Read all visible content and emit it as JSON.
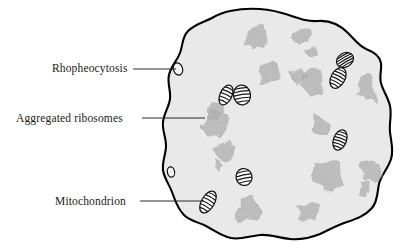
{
  "figure": {
    "background_color": "#ffffff",
    "cytoplasm_color": "#e9e9e9",
    "membrane_color": "#000000",
    "ribosome_color": "#9a9a9a",
    "mitochondrion_fill": "#ffffff",
    "mitochondrion_stroke": "#151515"
  },
  "labels": [
    {
      "id": "rhopheocytosis",
      "text": "Rhopheocytosis",
      "text_x": 52,
      "text_y": 72,
      "leader_x1": 133,
      "leader_y1": 69,
      "leader_x2": 176,
      "leader_y2": 69
    },
    {
      "id": "aggregated-ribosomes",
      "text": "Aggregated  ribosomes",
      "text_x": 16,
      "text_y": 122,
      "leader_x1": 142,
      "leader_y1": 118,
      "leader_x2": 205,
      "leader_y2": 118
    },
    {
      "id": "mitochondrion",
      "text": "Mitochondrion",
      "text_x": 55,
      "text_y": 205,
      "leader_x1": 140,
      "leader_y1": 201,
      "leader_x2": 204,
      "leader_y2": 201
    }
  ],
  "membrane_path": "M 230 11 C 250 7 268 9 282 13 C 296 17 305 22 318 21 C 330 20 340 25 348 33 C 355 40 359 46 366 49 C 374 52 380 56 381 63 C 382 70 379 76 381 83 C 383 91 388 97 390 106 C 392 115 389 123 390 132 C 391 142 394 150 391 159 C 388 169 381 175 379 184 C 377 193 378 201 372 208 C 365 216 356 219 347 222 C 337 225 329 230 320 234 C 310 238 300 240 290 239 C 279 238 270 234 260 235 C 249 236 241 240 231 238 C 221 236 214 230 206 226 C 198 222 190 221 184 215 C 177 208 175 200 172 192 C 169 184 164 178 163 170 C 162 161 166 154 166 146 C 166 137 162 130 163 122 C 164 113 169 107 170 99 C 171 90 167 83 169 75 C 171 66 177 61 180 53 C 183 45 182 37 188 31 C 195 24 204 22 212 18 C 219 14 224 12 230 11 Z",
  "vesicles": [
    {
      "id": "rhopheocytosis-vesicle-upper",
      "cx": 178,
      "cy": 69,
      "rx": 4.6,
      "ry": 6.2,
      "rot": -18
    },
    {
      "id": "rhopheocytosis-vesicle-lower",
      "cx": 171,
      "cy": 172,
      "rx": 3.6,
      "ry": 5.2,
      "rot": -10
    }
  ],
  "mitochondria": [
    {
      "id": "mito-1",
      "cx": 226,
      "cy": 95,
      "rx": 6.0,
      "ry": 10.5,
      "rot": 25,
      "cristae": 5
    },
    {
      "id": "mito-2",
      "cx": 242,
      "cy": 95,
      "rx": 8.5,
      "ry": 10.0,
      "rot": -8,
      "cristae": 5
    },
    {
      "id": "mito-3",
      "cx": 345,
      "cy": 60,
      "rx": 9.0,
      "ry": 7.0,
      "rot": -30,
      "cristae": 5
    },
    {
      "id": "mito-4",
      "cx": 338,
      "cy": 78,
      "rx": 7.0,
      "ry": 11.0,
      "rot": 28,
      "cristae": 6
    },
    {
      "id": "mito-5",
      "cx": 340,
      "cy": 140,
      "rx": 6.5,
      "ry": 10.5,
      "rot": 20,
      "cristae": 6
    },
    {
      "id": "mito-6",
      "cx": 244,
      "cy": 177,
      "rx": 8.0,
      "ry": 8.5,
      "rot": -12,
      "cristae": 4
    },
    {
      "id": "mito-7",
      "cx": 208,
      "cy": 202,
      "rx": 6.5,
      "ry": 12.0,
      "rot": 30,
      "cristae": 6
    }
  ],
  "ribosome_clusters": [
    {
      "id": "ribo-1",
      "cx": 258,
      "cy": 40,
      "r": 15,
      "lobes": 7
    },
    {
      "id": "ribo-2",
      "cx": 303,
      "cy": 35,
      "r": 11,
      "lobes": 6
    },
    {
      "id": "ribo-3",
      "cx": 310,
      "cy": 53,
      "r": 7,
      "lobes": 5
    },
    {
      "id": "ribo-4",
      "cx": 269,
      "cy": 74,
      "r": 13,
      "lobes": 7
    },
    {
      "id": "ribo-5",
      "cx": 299,
      "cy": 76,
      "r": 12,
      "lobes": 7
    },
    {
      "id": "ribo-6",
      "cx": 313,
      "cy": 82,
      "r": 13,
      "lobes": 7
    },
    {
      "id": "ribo-7",
      "cx": 367,
      "cy": 88,
      "r": 16,
      "lobes": 8
    },
    {
      "id": "ribo-8",
      "cx": 215,
      "cy": 110,
      "r": 9,
      "lobes": 6
    },
    {
      "id": "ribo-9",
      "cx": 213,
      "cy": 125,
      "r": 15,
      "lobes": 8
    },
    {
      "id": "ribo-10",
      "cx": 321,
      "cy": 124,
      "r": 11,
      "lobes": 6
    },
    {
      "id": "ribo-11",
      "cx": 226,
      "cy": 150,
      "r": 12,
      "lobes": 7
    },
    {
      "id": "ribo-12",
      "cx": 219,
      "cy": 165,
      "r": 8,
      "lobes": 5
    },
    {
      "id": "ribo-13",
      "cx": 327,
      "cy": 176,
      "r": 17,
      "lobes": 8
    },
    {
      "id": "ribo-14",
      "cx": 370,
      "cy": 170,
      "r": 15,
      "lobes": 8
    },
    {
      "id": "ribo-15",
      "cx": 364,
      "cy": 190,
      "r": 9,
      "lobes": 6
    },
    {
      "id": "ribo-16",
      "cx": 250,
      "cy": 210,
      "r": 15,
      "lobes": 8
    },
    {
      "id": "ribo-17",
      "cx": 311,
      "cy": 212,
      "r": 13,
      "lobes": 7
    }
  ]
}
